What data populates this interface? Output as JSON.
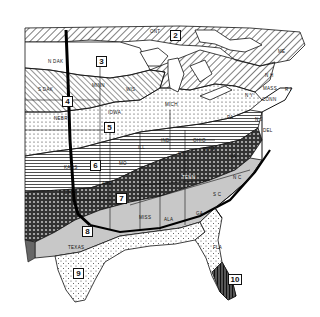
{
  "map": {
    "zones": [
      {
        "id": "2",
        "label": "2",
        "x": 170,
        "y": 30
      },
      {
        "id": "3",
        "label": "3",
        "x": 96,
        "y": 56
      },
      {
        "id": "4",
        "label": "4",
        "x": 62,
        "y": 96
      },
      {
        "id": "5",
        "label": "5",
        "x": 104,
        "y": 122
      },
      {
        "id": "6",
        "label": "6",
        "x": 90,
        "y": 160
      },
      {
        "id": "7",
        "label": "7",
        "x": 116,
        "y": 193
      },
      {
        "id": "8",
        "label": "8",
        "x": 82,
        "y": 226
      },
      {
        "id": "9",
        "label": "9",
        "x": 73,
        "y": 268
      },
      {
        "id": "10",
        "label": "10",
        "x": 228,
        "y": 274
      }
    ],
    "state_labels": [
      {
        "name": "N DAK",
        "x": 48,
        "y": 60
      },
      {
        "name": "S DAK",
        "x": 38,
        "y": 88
      },
      {
        "name": "MINN",
        "x": 92,
        "y": 84
      },
      {
        "name": "WIS",
        "x": 126,
        "y": 88
      },
      {
        "name": "NEBR",
        "x": 54,
        "y": 117
      },
      {
        "name": "IOWA",
        "x": 108,
        "y": 111
      },
      {
        "name": "ILL",
        "x": 138,
        "y": 146
      },
      {
        "name": "MICH",
        "x": 165,
        "y": 103
      },
      {
        "name": "IND",
        "x": 161,
        "y": 139
      },
      {
        "name": "OHIO",
        "x": 193,
        "y": 139
      },
      {
        "name": "PA",
        "x": 227,
        "y": 116
      },
      {
        "name": "W VA",
        "x": 203,
        "y": 148
      },
      {
        "name": "VA",
        "x": 230,
        "y": 155
      },
      {
        "name": "KY",
        "x": 178,
        "y": 152
      },
      {
        "name": "TENN",
        "x": 182,
        "y": 176
      },
      {
        "name": "MO",
        "x": 119,
        "y": 162
      },
      {
        "name": "KANS",
        "x": 64,
        "y": 166
      },
      {
        "name": "OKLA",
        "x": 64,
        "y": 191
      },
      {
        "name": "ARK",
        "x": 102,
        "y": 182
      },
      {
        "name": "TEXAS",
        "x": 68,
        "y": 246
      },
      {
        "name": "MISS",
        "x": 139,
        "y": 216
      },
      {
        "name": "ALA",
        "x": 164,
        "y": 218
      },
      {
        "name": "GA",
        "x": 196,
        "y": 212
      },
      {
        "name": "FLA",
        "x": 213,
        "y": 246
      },
      {
        "name": "S C",
        "x": 213,
        "y": 193
      },
      {
        "name": "N C",
        "x": 233,
        "y": 176
      },
      {
        "name": "DEL",
        "x": 263,
        "y": 129
      },
      {
        "name": "N J",
        "x": 255,
        "y": 118
      },
      {
        "name": "CONN",
        "x": 262,
        "y": 98
      },
      {
        "name": "MASS",
        "x": 263,
        "y": 87
      },
      {
        "name": "R I",
        "x": 285,
        "y": 88
      },
      {
        "name": "N Y",
        "x": 245,
        "y": 94
      },
      {
        "name": "N H",
        "x": 265,
        "y": 74
      },
      {
        "name": "ME",
        "x": 278,
        "y": 50
      },
      {
        "name": "ONT",
        "x": 150,
        "y": 30
      }
    ]
  }
}
